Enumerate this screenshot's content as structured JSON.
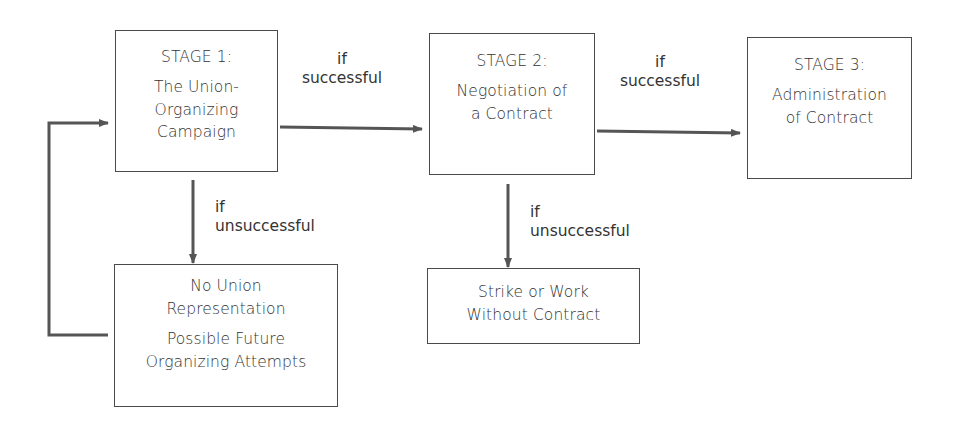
{
  "diagram": {
    "colors": {
      "line": "#555555",
      "box_border": "#4a4a4a",
      "text": "#333333",
      "background": "#ffffff"
    },
    "nodes": {
      "stage1": {
        "stage": "STAGE 1:",
        "lines": [
          "The Union-",
          "Organizing",
          "Campaign"
        ]
      },
      "stage2": {
        "stage": "STAGE 2:",
        "lines": [
          "Negotiation of",
          "a Contract"
        ]
      },
      "stage3": {
        "stage": "STAGE 3:",
        "lines": [
          "Administration",
          "of Contract"
        ]
      },
      "no_union": {
        "lines": [
          "No Union",
          "Representation"
        ],
        "lines2": [
          "Possible Future",
          "Organizing Attempts"
        ]
      },
      "strike": {
        "lines": [
          "Strike or Work",
          "Without Contract"
        ]
      }
    },
    "edges": {
      "stage1_to_stage2": {
        "label_line1": "if",
        "label_line2": "successful"
      },
      "stage2_to_stage3": {
        "label_line1": "if",
        "label_line2": "successful"
      },
      "stage1_to_no_union": {
        "label_line1": "if",
        "label_line2": "unsuccessful"
      },
      "stage2_to_strike": {
        "label_line1": "if",
        "label_line2": "unsuccessful"
      },
      "no_union_to_stage1": {
        "label_line1": "",
        "label_line2": ""
      }
    }
  }
}
